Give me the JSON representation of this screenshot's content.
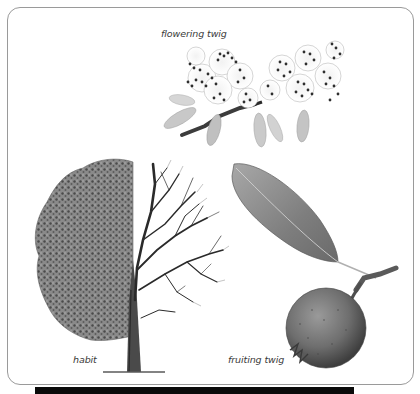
{
  "figure": {
    "captions": {
      "flowering_twig": "flowering twig",
      "habit": "habit",
      "fruiting_twig": "fruiting twig"
    },
    "illustrations": [
      {
        "id": "flowering-twig",
        "description": "two clusters of white five-petalled flowers with dark stamens, pale leaves, dark twig"
      },
      {
        "id": "habit",
        "description": "tree split view: left half in leaf, right half bare branches"
      },
      {
        "id": "fruiting-twig",
        "description": "single elongated leaf on stalk and a round grey-green fruit on a woody stem"
      }
    ],
    "colors": {
      "border": "#9a9a9a",
      "caption": "#3a3a3a",
      "bottom_bar": "#0a0a0a",
      "foliage": "#6e6e6e",
      "branches": "#2a2a2a",
      "leaf": "#8a8a8a",
      "fruit": "#6a6a6a"
    }
  }
}
